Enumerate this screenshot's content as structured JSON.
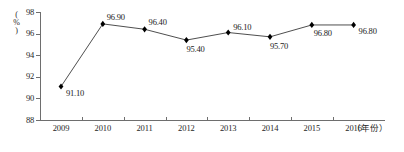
{
  "chart_data": {
    "type": "line",
    "title": "",
    "xlabel": "(年份)",
    "ylabel": "(%)",
    "categories": [
      "2009",
      "2010",
      "2011",
      "2012",
      "2013",
      "2014",
      "2015",
      "2016"
    ],
    "values": [
      91.1,
      96.9,
      96.4,
      95.4,
      96.1,
      95.7,
      96.8,
      96.8
    ],
    "point_labels": [
      "91.10",
      "96.90",
      "96.40",
      "95.40",
      "96.10",
      "95.70",
      "96.80",
      "96.80"
    ],
    "ylim": [
      88,
      98
    ],
    "y_ticks": [
      "88",
      "90",
      "92",
      "94",
      "96",
      "98"
    ],
    "y_tick_values": [
      88,
      90,
      92,
      94,
      96,
      98
    ],
    "grid": false,
    "legend": "none",
    "series_color": "#3a3a3a",
    "marker": "diamond",
    "marker_color": "#000000"
  },
  "axes": {
    "y_caption": "(%)",
    "x_caption": "（年份）"
  }
}
